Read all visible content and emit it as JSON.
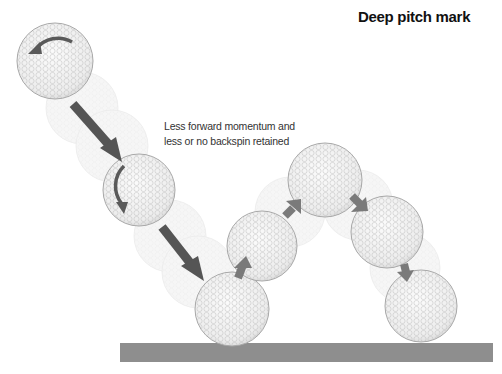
{
  "title": "Deep pitch mark",
  "annotation": {
    "line1": "Less forward momentum and",
    "line2": "less or no backspin retained"
  },
  "colors": {
    "ground": "#8e8e8e",
    "descent_arrow": "#555555",
    "bounce_arrow": "#7a7a7a",
    "spin_arrow": "#5a5a5a",
    "ball_fill": "#f2f2f2",
    "ball_dimple": "#b8b8b8",
    "ghost_ball": "#f4f4f4"
  },
  "diagram": {
    "balls": [
      {
        "id": "ball-1",
        "cx": 55,
        "cy": 61,
        "r": 38,
        "spin": "counterclockwise-strong"
      },
      {
        "id": "ball-2",
        "cx": 139,
        "cy": 190,
        "r": 36,
        "spin": "counterclockwise-weak"
      },
      {
        "id": "ball-3-impact",
        "cx": 232,
        "cy": 309,
        "r": 37
      },
      {
        "id": "ball-4",
        "cx": 262,
        "cy": 246,
        "r": 35
      },
      {
        "id": "ball-5-apex",
        "cx": 325,
        "cy": 180,
        "r": 37
      },
      {
        "id": "ball-6",
        "cx": 387,
        "cy": 232,
        "r": 36
      },
      {
        "id": "ball-7",
        "cx": 421,
        "cy": 306,
        "r": 36
      }
    ],
    "ghost_balls": [
      {
        "cx": 82,
        "cy": 108,
        "r": 36
      },
      {
        "cx": 112,
        "cy": 146,
        "r": 36
      },
      {
        "cx": 170,
        "cy": 236,
        "r": 36
      },
      {
        "cx": 198,
        "cy": 272,
        "r": 36
      },
      {
        "cx": 290,
        "cy": 212,
        "r": 35
      },
      {
        "cx": 358,
        "cy": 205,
        "r": 35
      },
      {
        "cx": 405,
        "cy": 268,
        "r": 35
      }
    ],
    "ground": {
      "x": 120,
      "y": 343,
      "width": 373,
      "height": 19
    }
  }
}
